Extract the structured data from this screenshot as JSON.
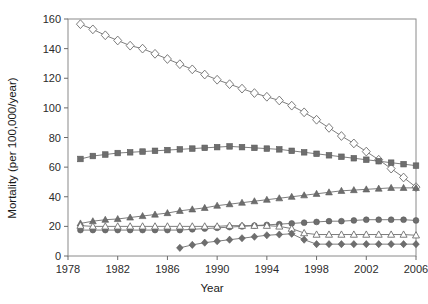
{
  "chart_data": {
    "type": "line",
    "title": "",
    "xlabel": "Year",
    "ylabel": "Mortality (per 100,000/year)",
    "xlim": [
      1978,
      2006
    ],
    "ylim": [
      0,
      160
    ],
    "xticks": [
      1978,
      1982,
      1986,
      1990,
      1994,
      1998,
      2002,
      2006
    ],
    "yticks": [
      0,
      20,
      40,
      60,
      80,
      100,
      120,
      140,
      160
    ],
    "xtick_labels": [
      "1978",
      "1982",
      "1986",
      "1990",
      "1994",
      "1998",
      "2002",
      "2006"
    ],
    "ytick_labels": [
      "0",
      "20",
      "40",
      "60",
      "80",
      "100",
      "120",
      "140",
      "160"
    ],
    "grid": false,
    "legend": "none",
    "x": [
      1979,
      1980,
      1981,
      1982,
      1983,
      1984,
      1985,
      1986,
      1987,
      1988,
      1989,
      1990,
      1991,
      1992,
      1993,
      1994,
      1995,
      1996,
      1997,
      1998,
      1999,
      2000,
      2001,
      2002,
      2003,
      2004,
      2005,
      2006
    ],
    "series": [
      {
        "name": "open-diamond-series",
        "marker": "open-diamond",
        "color": "#6e6e6e",
        "values": [
          156.5,
          153.0,
          149.0,
          145.5,
          142.0,
          140.0,
          136.5,
          133.0,
          129.5,
          126.0,
          122.5,
          119.0,
          116.0,
          113.0,
          110.0,
          107.5,
          105.0,
          101.5,
          97.0,
          92.0,
          86.5,
          81.0,
          76.0,
          70.5,
          65.0,
          59.0,
          53.0,
          46.5
        ]
      },
      {
        "name": "filled-square-series",
        "marker": "filled-square",
        "color": "#6e6e6e",
        "values": [
          65.5,
          67.5,
          68.5,
          69.5,
          70.0,
          70.5,
          71.0,
          71.5,
          72.0,
          72.5,
          73.0,
          73.5,
          74.0,
          73.5,
          73.0,
          72.5,
          72.0,
          71.0,
          70.0,
          69.0,
          68.0,
          67.0,
          66.0,
          65.0,
          64.0,
          63.0,
          62.0,
          61.0
        ]
      },
      {
        "name": "filled-triangle-series",
        "marker": "filled-triangle",
        "color": "#6e6e6e",
        "values": [
          22.0,
          23.5,
          24.5,
          25.0,
          26.0,
          27.0,
          28.0,
          29.0,
          30.5,
          31.5,
          32.5,
          34.0,
          35.0,
          36.0,
          37.0,
          38.0,
          39.0,
          40.0,
          41.0,
          42.0,
          43.0,
          44.0,
          44.5,
          45.0,
          45.5,
          46.0,
          46.0,
          46.0
        ]
      },
      {
        "name": "filled-circle-series",
        "marker": "filled-circle",
        "color": "#6e6e6e",
        "values": [
          17.5,
          17.5,
          17.5,
          17.5,
          17.5,
          17.5,
          17.5,
          17.5,
          17.5,
          18.0,
          18.5,
          19.0,
          19.5,
          20.0,
          20.5,
          21.0,
          21.5,
          22.0,
          22.5,
          23.0,
          23.5,
          23.5,
          24.0,
          24.5,
          24.5,
          24.5,
          24.5,
          24.0
        ]
      },
      {
        "name": "open-triangle-series",
        "marker": "open-triangle",
        "color": "#6e6e6e",
        "values": [
          20.5,
          20.0,
          20.0,
          20.0,
          20.0,
          20.0,
          20.0,
          20.0,
          20.0,
          20.0,
          20.0,
          20.0,
          20.5,
          20.5,
          20.5,
          20.5,
          20.0,
          18.5,
          15.5,
          14.5,
          14.5,
          14.5,
          14.5,
          14.5,
          14.5,
          14.5,
          14.5,
          14.0
        ]
      },
      {
        "name": "filled-diamond-series",
        "marker": "filled-diamond",
        "color": "#6e6e6e",
        "start_year": 1987,
        "values": [
          null,
          null,
          null,
          null,
          null,
          null,
          null,
          null,
          5.5,
          7.5,
          9.0,
          10.0,
          11.0,
          12.0,
          13.0,
          14.0,
          14.5,
          15.0,
          11.0,
          8.0,
          8.0,
          8.0,
          8.0,
          8.0,
          8.0,
          8.0,
          8.0,
          8.0
        ]
      }
    ]
  }
}
